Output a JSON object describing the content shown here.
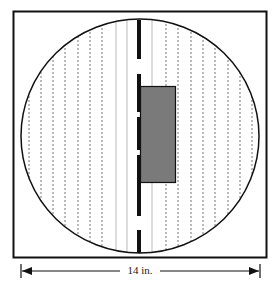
{
  "diagram": {
    "dimension_label": "14 in.",
    "colors": {
      "outline": "#111111",
      "rectangle_fill": "#7a7a7a",
      "dashed_lines": "#777777",
      "solid_lines": "#bbbbbb",
      "background": "#ffffff"
    }
  }
}
